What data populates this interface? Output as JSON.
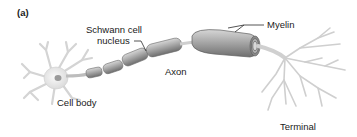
{
  "figure": {
    "panel_label": "(a)",
    "labels": {
      "schwann_line1": "Schwann cell",
      "schwann_line2": "nucleus",
      "myelin": "Myelin",
      "axon": "Axon",
      "cell_body": "Cell body",
      "terminal": "Terminal"
    },
    "colors": {
      "background": "#ffffff",
      "cell_fill": "#ededed",
      "myelin_dark": "#7a7a7a",
      "myelin_mid": "#a6a6a6",
      "myelin_light": "#d2d2d2",
      "text": "#1a1a1a"
    }
  }
}
